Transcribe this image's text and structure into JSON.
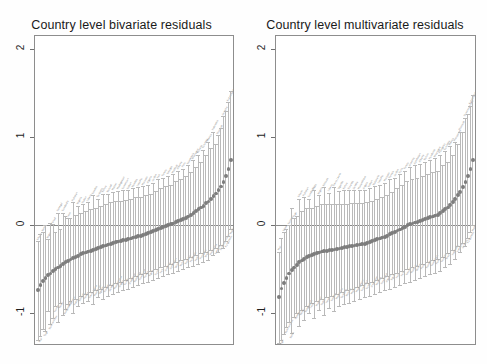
{
  "figure": {
    "background": "#ffffff",
    "axis_color": "#8d8d8d",
    "point_color": "#7d7d7d",
    "whisker_color": "#b9b9b9",
    "label_color": "#8c8c8c"
  },
  "panels": [
    {
      "id": "bivariate",
      "title": "Country level bivariate residuals"
    },
    {
      "id": "multivariate",
      "title": "Country level multivariate residuals"
    }
  ],
  "chart_data": [
    {
      "type": "scatter",
      "title": "Country level bivariate residuals",
      "xlabel": "",
      "ylabel": "",
      "ylim": [
        -1.35,
        2.15
      ],
      "yticks": [
        2,
        1,
        0,
        -1
      ],
      "ytick_labels": [
        "2",
        "1",
        "0",
        "-1"
      ],
      "grid": false,
      "legend": null,
      "zero_line": 0,
      "n_points": 78,
      "x": [
        1,
        2,
        3,
        4,
        5,
        6,
        7,
        8,
        9,
        10,
        11,
        12,
        13,
        14,
        15,
        16,
        17,
        18,
        19,
        20,
        21,
        22,
        23,
        24,
        25,
        26,
        27,
        28,
        29,
        30,
        31,
        32,
        33,
        34,
        35,
        36,
        37,
        38,
        39,
        40,
        41,
        42,
        43,
        44,
        45,
        46,
        47,
        48,
        49,
        50,
        51,
        52,
        53,
        54,
        55,
        56,
        57,
        58,
        59,
        60,
        61,
        62,
        63,
        64,
        65,
        66,
        67,
        68,
        69,
        70,
        71,
        72,
        73,
        74,
        75,
        76,
        77,
        78
      ],
      "values": [
        -0.74,
        -0.68,
        -0.63,
        -0.6,
        -0.57,
        -0.55,
        -0.52,
        -0.5,
        -0.48,
        -0.46,
        -0.44,
        -0.42,
        -0.41,
        -0.39,
        -0.37,
        -0.36,
        -0.35,
        -0.33,
        -0.32,
        -0.31,
        -0.3,
        -0.29,
        -0.28,
        -0.27,
        -0.26,
        -0.25,
        -0.24,
        -0.23,
        -0.22,
        -0.21,
        -0.2,
        -0.19,
        -0.185,
        -0.18,
        -0.17,
        -0.165,
        -0.16,
        -0.15,
        -0.14,
        -0.13,
        -0.125,
        -0.12,
        -0.11,
        -0.1,
        -0.09,
        -0.08,
        -0.07,
        -0.055,
        -0.04,
        -0.03,
        -0.02,
        -0.01,
        0.0,
        0.01,
        0.02,
        0.04,
        0.05,
        0.06,
        0.07,
        0.085,
        0.1,
        0.12,
        0.14,
        0.16,
        0.18,
        0.2,
        0.22,
        0.25,
        0.27,
        0.3,
        0.33,
        0.36,
        0.4,
        0.44,
        0.49,
        0.56,
        0.64,
        0.74
      ],
      "ci_lower": [
        -1.3,
        -1.26,
        -1.18,
        -1.2,
        -0.98,
        -1.12,
        -1.05,
        -0.92,
        -1.1,
        -0.88,
        -1.02,
        -0.95,
        -0.9,
        -0.86,
        -1.0,
        -0.84,
        -0.92,
        -0.8,
        -0.88,
        -0.78,
        -0.86,
        -0.76,
        -0.9,
        -0.74,
        -0.82,
        -0.72,
        -0.84,
        -0.7,
        -0.8,
        -0.68,
        -0.78,
        -0.66,
        -0.76,
        -0.64,
        -0.74,
        -0.62,
        -0.72,
        -0.6,
        -0.7,
        -0.58,
        -0.68,
        -0.56,
        -0.66,
        -0.54,
        -0.64,
        -0.52,
        -0.62,
        -0.5,
        -0.6,
        -0.48,
        -0.58,
        -0.46,
        -0.56,
        -0.44,
        -0.54,
        -0.42,
        -0.52,
        -0.4,
        -0.5,
        -0.38,
        -0.48,
        -0.36,
        -0.46,
        -0.34,
        -0.44,
        -0.32,
        -0.42,
        -0.3,
        -0.4,
        -0.28,
        -0.34,
        -0.26,
        -0.3,
        -0.22,
        -0.26,
        -0.18,
        -0.12,
        -0.04
      ],
      "ci_upper": [
        -0.18,
        -0.1,
        -0.08,
        0.0,
        -0.16,
        0.02,
        0.01,
        -0.08,
        0.14,
        -0.04,
        0.14,
        0.11,
        0.08,
        0.08,
        0.26,
        0.12,
        0.22,
        0.14,
        0.24,
        0.16,
        0.26,
        0.18,
        0.34,
        0.2,
        0.3,
        0.22,
        0.36,
        0.24,
        0.36,
        0.26,
        0.38,
        0.28,
        0.39,
        0.28,
        0.4,
        0.29,
        0.4,
        0.3,
        0.42,
        0.32,
        0.43,
        0.32,
        0.44,
        0.34,
        0.46,
        0.36,
        0.48,
        0.39,
        0.52,
        0.42,
        0.54,
        0.44,
        0.56,
        0.46,
        0.58,
        0.5,
        0.62,
        0.52,
        0.64,
        0.56,
        0.68,
        0.6,
        0.74,
        0.66,
        0.8,
        0.72,
        0.86,
        0.8,
        0.94,
        0.88,
        1.06,
        0.92,
        1.02,
        1.1,
        1.24,
        1.3,
        1.4,
        1.52
      ],
      "point_labels": [
        "Ghana",
        "Mali",
        "Benin",
        "Togo",
        "Niger",
        "Burkina Faso",
        "Chad",
        "Guinea",
        "Senegal",
        "Nepal",
        "Cambodia",
        "Bangladesh",
        "Laos",
        "Myanmar",
        "Pakistan",
        "India",
        "Nigeria",
        "Ethiopia",
        "Sudan",
        "Yemen",
        "Liberia",
        "Sierra Leone",
        "Gambia",
        "Mauritania",
        "Tanzania",
        "Uganda",
        "Kenya",
        "Rwanda",
        "Burundi",
        "Zambia",
        "Malawi",
        "Mozambique",
        "Madagascar",
        "Angola",
        "Cameroon",
        "Congo",
        "Gabon",
        "Zimbabwe",
        "Namibia",
        "Botswana",
        "Lesotho",
        "Swaziland",
        "Morocco",
        "Tunisia",
        "Algeria",
        "Egypt",
        "Jordan",
        "Syria",
        "Iraq",
        "Iran",
        "Turkey",
        "Armenia",
        "Georgia",
        "Azerbaijan",
        "Moldova",
        "Ukraine",
        "Albania",
        "Bolivia",
        "Peru",
        "Ecuador",
        "Guatemala",
        "Honduras",
        "Nicaragua",
        "Haiti",
        "Guyana",
        "Paraguay",
        "Colombia",
        "Brazil",
        "Mexico",
        "Philippines",
        "Indonesia",
        "Vietnam",
        "Thailand",
        "Dominican Rep.",
        "Jamaica",
        "Kyrgyzstan",
        "Kazakhstan",
        "Maldives"
      ]
    },
    {
      "type": "scatter",
      "title": "Country level multivariate residuals",
      "xlabel": "",
      "ylabel": "",
      "ylim": [
        -1.35,
        2.15
      ],
      "yticks": [
        2,
        1,
        0,
        -1
      ],
      "ytick_labels": [
        "2",
        "1",
        "0",
        "-1"
      ],
      "grid": false,
      "legend": null,
      "zero_line": 0,
      "n_points": 78,
      "x": [
        1,
        2,
        3,
        4,
        5,
        6,
        7,
        8,
        9,
        10,
        11,
        12,
        13,
        14,
        15,
        16,
        17,
        18,
        19,
        20,
        21,
        22,
        23,
        24,
        25,
        26,
        27,
        28,
        29,
        30,
        31,
        32,
        33,
        34,
        35,
        36,
        37,
        38,
        39,
        40,
        41,
        42,
        43,
        44,
        45,
        46,
        47,
        48,
        49,
        50,
        51,
        52,
        53,
        54,
        55,
        56,
        57,
        58,
        59,
        60,
        61,
        62,
        63,
        64,
        65,
        66,
        67,
        68,
        69,
        70,
        71,
        72,
        73,
        74,
        75,
        76,
        77,
        78
      ],
      "values": [
        -0.82,
        -0.72,
        -0.66,
        -0.6,
        -0.55,
        -0.51,
        -0.48,
        -0.45,
        -0.42,
        -0.4,
        -0.38,
        -0.36,
        -0.35,
        -0.34,
        -0.33,
        -0.32,
        -0.31,
        -0.3,
        -0.295,
        -0.29,
        -0.285,
        -0.28,
        -0.275,
        -0.27,
        -0.265,
        -0.26,
        -0.25,
        -0.245,
        -0.24,
        -0.235,
        -0.23,
        -0.225,
        -0.22,
        -0.215,
        -0.21,
        -0.2,
        -0.19,
        -0.18,
        -0.17,
        -0.16,
        -0.15,
        -0.14,
        -0.13,
        -0.12,
        -0.1,
        -0.09,
        -0.08,
        -0.06,
        -0.05,
        -0.03,
        -0.02,
        0.0,
        0.01,
        0.02,
        0.03,
        0.04,
        0.05,
        0.06,
        0.07,
        0.08,
        0.09,
        0.1,
        0.11,
        0.12,
        0.14,
        0.16,
        0.18,
        0.2,
        0.23,
        0.26,
        0.3,
        0.34,
        0.38,
        0.43,
        0.49,
        0.56,
        0.64,
        0.74
      ],
      "ci_lower": [
        -1.34,
        -1.3,
        -1.24,
        -1.16,
        -1.1,
        -1.22,
        -1.04,
        -1.0,
        -1.14,
        -0.96,
        -1.08,
        -0.92,
        -1.0,
        -0.88,
        -1.06,
        -0.86,
        -0.96,
        -0.84,
        -1.02,
        -0.82,
        -0.94,
        -0.8,
        -0.98,
        -0.78,
        -0.92,
        -0.76,
        -0.9,
        -0.74,
        -0.88,
        -0.72,
        -0.86,
        -0.7,
        -0.84,
        -0.68,
        -0.82,
        -0.66,
        -0.8,
        -0.64,
        -0.78,
        -0.62,
        -0.76,
        -0.6,
        -0.74,
        -0.58,
        -0.72,
        -0.56,
        -0.7,
        -0.54,
        -0.68,
        -0.52,
        -0.66,
        -0.5,
        -0.64,
        -0.48,
        -0.62,
        -0.46,
        -0.6,
        -0.44,
        -0.58,
        -0.42,
        -0.56,
        -0.4,
        -0.54,
        -0.38,
        -0.52,
        -0.36,
        -0.48,
        -0.32,
        -0.44,
        -0.28,
        -0.38,
        -0.24,
        -0.3,
        -0.2,
        -0.24,
        -0.14,
        -0.08,
        0.0
      ],
      "ci_upper": [
        -0.3,
        -0.14,
        -0.08,
        -0.04,
        0.0,
        0.2,
        0.08,
        0.1,
        0.3,
        0.16,
        0.32,
        0.2,
        0.3,
        0.2,
        0.4,
        0.22,
        0.34,
        0.24,
        0.43,
        0.24,
        0.37,
        0.24,
        0.43,
        0.24,
        0.39,
        0.24,
        0.4,
        0.24,
        0.4,
        0.25,
        0.4,
        0.25,
        0.4,
        0.25,
        0.4,
        0.26,
        0.42,
        0.28,
        0.44,
        0.3,
        0.46,
        0.32,
        0.48,
        0.34,
        0.52,
        0.38,
        0.54,
        0.42,
        0.58,
        0.46,
        0.62,
        0.5,
        0.66,
        0.52,
        0.68,
        0.54,
        0.7,
        0.56,
        0.72,
        0.58,
        0.74,
        0.6,
        0.76,
        0.62,
        0.8,
        0.68,
        0.84,
        0.72,
        0.9,
        0.8,
        0.94,
        0.92,
        1.06,
        1.06,
        1.22,
        1.26,
        1.36,
        1.48
      ],
      "point_labels": [
        "Mali",
        "Niger",
        "Chad",
        "Burkina Faso",
        "Guinea",
        "Benin",
        "Togo",
        "Senegal",
        "Ghana",
        "Nepal",
        "Pakistan",
        "Bangladesh",
        "Cambodia",
        "Laos",
        "India",
        "Myanmar",
        "Nigeria",
        "Sudan",
        "Ethiopia",
        "Yemen",
        "Liberia",
        "Gambia",
        "Sierra Leone",
        "Mauritania",
        "Uganda",
        "Tanzania",
        "Kenya",
        "Burundi",
        "Rwanda",
        "Malawi",
        "Zambia",
        "Madagascar",
        "Mozambique",
        "Cameroon",
        "Angola",
        "Congo",
        "Gabon",
        "Zimbabwe",
        "Botswana",
        "Namibia",
        "Lesotho",
        "Swaziland",
        "Morocco",
        "Algeria",
        "Tunisia",
        "Egypt",
        "Jordan",
        "Iraq",
        "Syria",
        "Iran",
        "Turkey",
        "Georgia",
        "Armenia",
        "Moldova",
        "Azerbaijan",
        "Ukraine",
        "Albania",
        "Peru",
        "Bolivia",
        "Ecuador",
        "Honduras",
        "Guatemala",
        "Nicaragua",
        "Haiti",
        "Paraguay",
        "Guyana",
        "Colombia",
        "Brazil",
        "Mexico",
        "Indonesia",
        "Philippines",
        "Vietnam",
        "Thailand",
        "Jamaica",
        "Dominican Rep.",
        "Kyrgyzstan",
        "Kazakhstan",
        "Maldives"
      ]
    }
  ]
}
